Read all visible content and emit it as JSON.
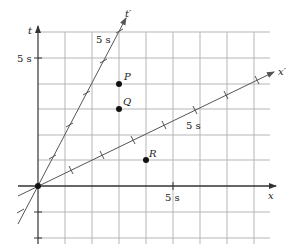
{
  "diagram": {
    "type": "spacetime-diagram",
    "axes": {
      "x": {
        "label": "x",
        "tick_label": "5 s"
      },
      "t": {
        "label": "t",
        "tick_label": "5 s"
      },
      "x_prime": {
        "label": "x′",
        "tick_label": "5 s"
      },
      "t_prime": {
        "label": "t′",
        "tick_label": "5 s"
      }
    },
    "events": [
      {
        "label": "P",
        "x": 3,
        "t": 4
      },
      {
        "label": "Q",
        "x": 3,
        "t": 3
      },
      {
        "label": "R",
        "x": 4,
        "t": 1
      }
    ],
    "grid": {
      "x_range": [
        0,
        8
      ],
      "t_range": [
        -2,
        6
      ],
      "unit_seconds": 1
    },
    "colors": {
      "grid": "#b5b5b5",
      "axis": "#333333",
      "primed_axis": "#666666",
      "point": "#111111"
    }
  }
}
